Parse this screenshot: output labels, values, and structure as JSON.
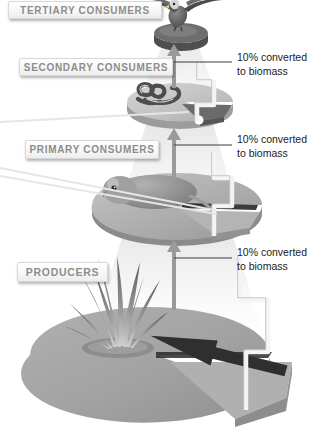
{
  "diagram": {
    "background_color": "#ffffff"
  },
  "levels": [
    {
      "id": "tertiary",
      "label": "TERTIARY CONSUMERS",
      "organism": "eagle",
      "platform_color": "#6e6e6e"
    },
    {
      "id": "secondary",
      "label": "SECONDARY CONSUMERS",
      "organism": "snake",
      "platform_color": "#b9b9b9"
    },
    {
      "id": "primary",
      "label": "PRIMARY CONSUMERS",
      "organism": "rodent",
      "platform_color": "#a8a8a8"
    },
    {
      "id": "producers",
      "label": "PRODUCERS",
      "organism": "grass",
      "platform_color": "#a0a0a0"
    }
  ],
  "callouts": [
    {
      "id": "callout-1",
      "line1": "10% converted",
      "line2": "to biomass"
    },
    {
      "id": "callout-2",
      "line1": "10% converted",
      "line2": "to biomass"
    },
    {
      "id": "callout-3",
      "line1": "10% converted",
      "line2": "to biomass"
    }
  ],
  "colors": {
    "plate_text": "#8d8d8d",
    "callout_text": "#1c1c1c",
    "arrow": "#9a9a9a",
    "leader_line": "#3a3a3a",
    "disc_top": "#a3a3a3",
    "disc_side": "#8a8a8a",
    "wedge_top": "#adadad",
    "wedge_side": "#8f8f8f",
    "beam": "#f2f2f2"
  }
}
